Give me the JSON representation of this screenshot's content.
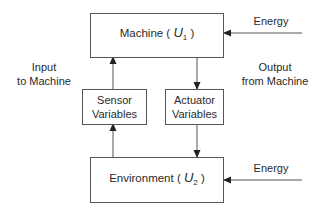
{
  "diagram": {
    "type": "block-diagram",
    "nodes": {
      "machine": {
        "label": "Machine (",
        "symbol": "U",
        "subscript": "1",
        "close": ")"
      },
      "environment": {
        "label": "Environment (",
        "symbol": "U",
        "subscript": "2",
        "close": ")"
      },
      "sensor": {
        "line1": "Sensor",
        "line2": "Variables"
      },
      "actuator": {
        "line1": "Actuator",
        "line2": "Variables"
      }
    },
    "labels": {
      "input": {
        "line1": "Input",
        "line2": "to Machine"
      },
      "output": {
        "line1": "Output",
        "line2": "from Machine"
      },
      "energy_top": "Energy",
      "energy_bottom": "Energy"
    },
    "edges": [
      {
        "from": "energy_top",
        "to": "machine"
      },
      {
        "from": "energy_bottom",
        "to": "environment"
      },
      {
        "from": "environment",
        "to": "sensor"
      },
      {
        "from": "sensor",
        "to": "machine"
      },
      {
        "from": "machine",
        "to": "actuator"
      },
      {
        "from": "actuator",
        "to": "environment"
      }
    ],
    "colors": {
      "line": "#555555",
      "text": "#2a2a2a",
      "background": "#ffffff"
    }
  }
}
